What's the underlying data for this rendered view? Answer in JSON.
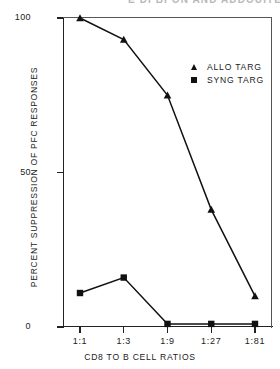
{
  "clipped_header": "E DI BI ON AND ADDOUITEDATIONS",
  "chart_data": {
    "type": "line",
    "title": "",
    "xlabel": "CD8 TO B CELL RATIOS",
    "ylabel": "PERCENT SUPPRESSION OF PFC RESPONSES",
    "categories": [
      "1:1",
      "1:3",
      "1:9",
      "1:27",
      "1:81"
    ],
    "ylim": [
      0,
      100
    ],
    "yticks": [
      0,
      50,
      100
    ],
    "ytick_labels": [
      "0",
      "50",
      "100"
    ],
    "grid": false,
    "legend_position": "upper right",
    "series": [
      {
        "name": "ALLO TARG",
        "marker": "triangle",
        "color": "#111111",
        "values": [
          100,
          93,
          75,
          38,
          10
        ]
      },
      {
        "name": "SYNG TARG",
        "marker": "square",
        "color": "#111111",
        "values": [
          11,
          16,
          1,
          1,
          1
        ]
      }
    ]
  },
  "legend": {
    "items": [
      {
        "label": "ALLO TARG",
        "marker": "triangle-marker"
      },
      {
        "label": "SYNG TARG",
        "marker": "square-marker"
      }
    ]
  }
}
